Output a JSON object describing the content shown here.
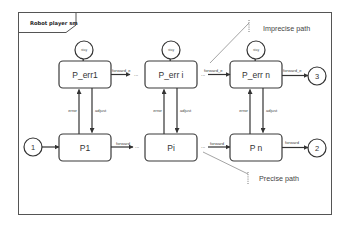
{
  "diagram": {
    "title": "Robot player sm",
    "states": {
      "p_err1": "P_err1",
      "p_erri": "P_err i",
      "p_errn": "P_err n",
      "p1": "P1",
      "pi": "Pi",
      "pn": "P n"
    },
    "self_loops": {
      "p_err1": "stay",
      "p_erri": "stay",
      "p_errn": "stay"
    },
    "terminals": {
      "start": "1",
      "precise_end": "2",
      "imprecise_end": "3"
    },
    "edges": {
      "err1_forward": "forward_e",
      "erri_forward": "forward_e",
      "errn_forward": "forward_e",
      "p1_forward": "forward",
      "pi_forward": "forward",
      "pn_forward": "forward",
      "error": "error",
      "adjust": "adjust"
    },
    "ellipsis": "...",
    "annotations": {
      "imprecise": "Imprecise path",
      "precise": "Precise path"
    }
  }
}
